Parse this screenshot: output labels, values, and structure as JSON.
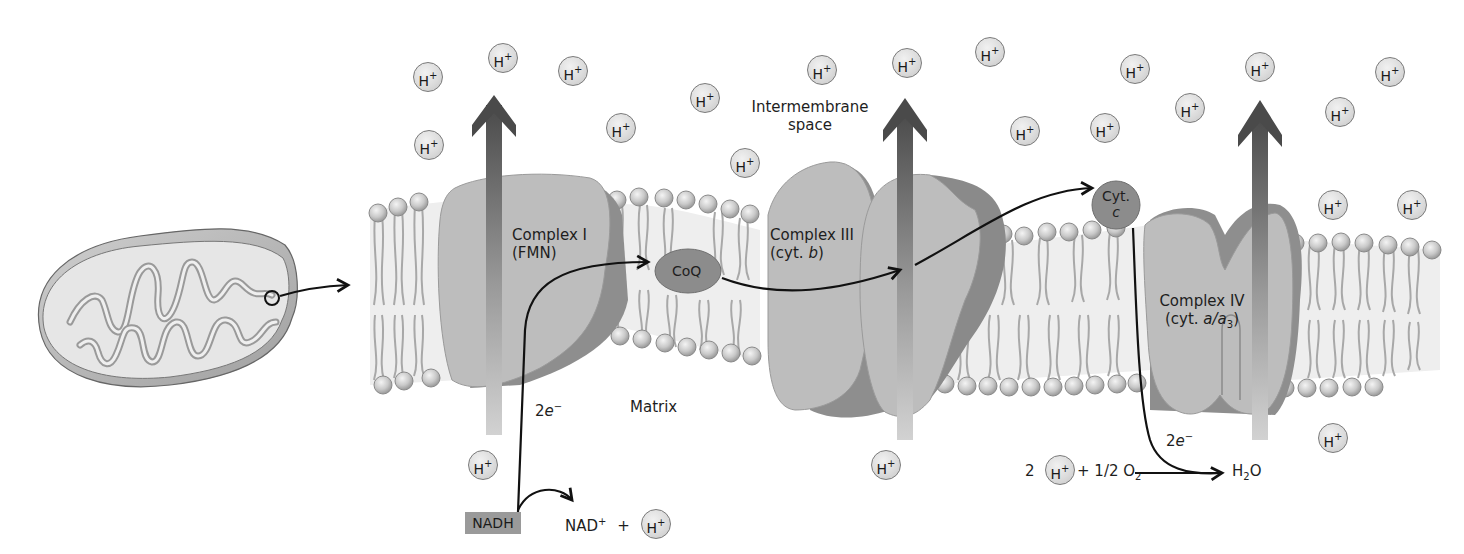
{
  "diagram": {
    "type": "mitochondrial electron transport chain",
    "regions": {
      "intermembrane_space": "Intermembrane\nspace",
      "intermembrane_line1": "Intermembrane",
      "intermembrane_line2": "space",
      "matrix": "Matrix"
    },
    "complexes": [
      {
        "id": "complex-1",
        "name": "Complex I",
        "cofactor": "(FMN)"
      },
      {
        "id": "complex-3",
        "name": "Complex III",
        "cofactor_prefix": "(cyt. ",
        "cofactor_italic": "b",
        "cofactor_suffix": ")"
      },
      {
        "id": "complex-4",
        "name": "Complex IV",
        "cofactor_prefix": "(cyt. ",
        "cofactor_italic": "a/a",
        "cofactor_sub": "3",
        "cofactor_suffix": ")"
      }
    ],
    "carriers": {
      "coq": "CoQ",
      "cytc_line1": "Cyt.",
      "cytc_line2": "c"
    },
    "electron_labels": {
      "e1_coef": "2",
      "e1_sym": "e",
      "e1_charge": "−",
      "e2_coef": "2",
      "e2_sym": "e",
      "e2_charge": "−"
    },
    "nadh_reaction": {
      "reactant": "NADH",
      "product": "NAD",
      "product_charge": "+",
      "plus": "+"
    },
    "water_reaction": {
      "coefficient": "2",
      "plus_text": "+ 1/2 O",
      "o2_sub": "2",
      "product_h": "H",
      "product_sub": "2",
      "product_o": "O"
    },
    "proton": {
      "symbol": "H",
      "charge": "+"
    },
    "proton_positions": [
      [
        428,
        77
      ],
      [
        503,
        58
      ],
      [
        573,
        71
      ],
      [
        429,
        145
      ],
      [
        621,
        128
      ],
      [
        705,
        98
      ],
      [
        745,
        163
      ],
      [
        822,
        70
      ],
      [
        907,
        63
      ],
      [
        990,
        52
      ],
      [
        1025,
        131
      ],
      [
        1105,
        128
      ],
      [
        1135,
        69
      ],
      [
        1190,
        108
      ],
      [
        1260,
        67
      ],
      [
        1340,
        112
      ],
      [
        1390,
        72
      ],
      [
        1333,
        205
      ],
      [
        1412,
        205
      ],
      [
        1333,
        438
      ],
      [
        483,
        465
      ],
      [
        886,
        465
      ]
    ],
    "colors": {
      "protein_light": "#b9b9b9",
      "protein_dark": "#8a8a8a",
      "carrier": "#8c8c8c",
      "proton_fill": "#dcdcdc",
      "arrow_dark": "#4a4a4a",
      "lipid_head": "#cfcfcf"
    }
  }
}
